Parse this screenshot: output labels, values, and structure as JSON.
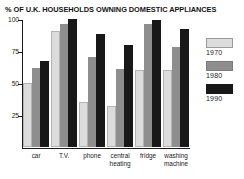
{
  "chart_data": {
    "type": "bar",
    "title": "% OF U.K. HOUSEHOLDS OWNING DOMESTIC APPLIANCES",
    "xlabel": "",
    "ylabel": "",
    "ylim": [
      0,
      100
    ],
    "yticks": [
      25,
      50,
      75,
      100
    ],
    "ytick_labels": [
      "25",
      "50",
      "75",
      "100"
    ],
    "grid": false,
    "legend_position": "right",
    "categories": [
      "car",
      "T.V.",
      "phone",
      "central heating",
      "fridge",
      "washing machine"
    ],
    "series": [
      {
        "name": "1970",
        "color": "#dcdcdc",
        "values": [
          50,
          91,
          35,
          32,
          60,
          60
        ]
      },
      {
        "name": "1980",
        "color": "#8e8e8e",
        "values": [
          62,
          96,
          70,
          61,
          96,
          78
        ]
      },
      {
        "name": "1990",
        "color": "#181818",
        "values": [
          67,
          100,
          88,
          80,
          99,
          92
        ]
      }
    ]
  },
  "legend": {
    "entries": [
      {
        "label": "1970",
        "swatch": "light-gray-swatch"
      },
      {
        "label": "1980",
        "swatch": "medium-gray-swatch"
      },
      {
        "label": "1990",
        "swatch": "black-swatch"
      }
    ]
  }
}
